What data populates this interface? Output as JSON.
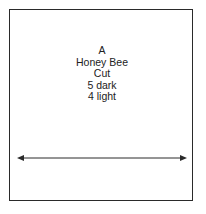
{
  "block": {
    "lines": [
      "A",
      "Honey Bee",
      "Cut",
      "5 dark",
      "4 light"
    ]
  },
  "arrow": {
    "direction": "double-headed-horizontal",
    "color": "#2a2a2a"
  },
  "colors": {
    "border": "#2a2a2a",
    "text": "#222222",
    "background": "#ffffff"
  }
}
